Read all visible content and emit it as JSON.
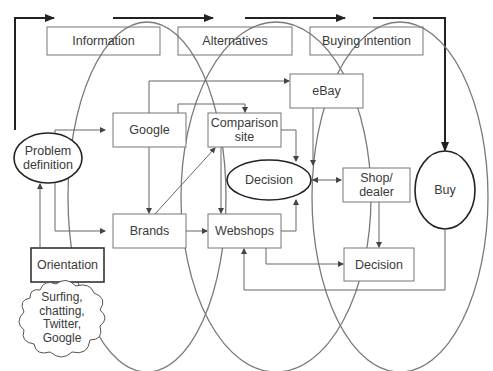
{
  "diagram": {
    "stages": [
      "Information",
      "Alternatives",
      "Buying intention"
    ],
    "nodes": {
      "problem_definition": "Problem definition",
      "problem_line1": "Problem",
      "problem_line2": "definition",
      "orientation": "Orientation",
      "cloud_line1": "Surfing,",
      "cloud_line2": "chatting,",
      "cloud_line3": "Twitter,",
      "cloud_line4": "Google",
      "google": "Google",
      "brands": "Brands",
      "comparison_line1": "Comparison",
      "comparison_line2": "site",
      "webshops": "Webshops",
      "ebay": "eBay",
      "decision_center": "Decision",
      "shop_line1": "Shop/",
      "shop_line2": "dealer",
      "decision_box": "Decision",
      "buy": "Buy"
    },
    "colors": {
      "line": "#6a6a6a",
      "bold_line": "#222222",
      "text": "#3a3a3a",
      "background": "#ffffff"
    }
  }
}
